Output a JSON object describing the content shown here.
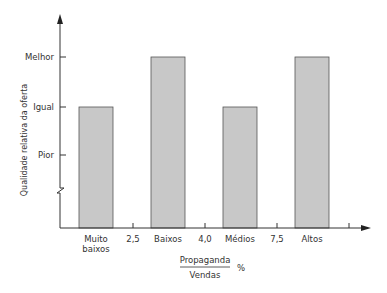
{
  "chart_data": {
    "type": "bar",
    "title": "",
    "ylabel": "Qualidade relativa da oferta",
    "xlabel_numerator": "Propaganda",
    "xlabel_denominator": "Vendas",
    "xlabel_unit": "%",
    "y_ticks": [
      "Pior",
      "Igual",
      "Melhor"
    ],
    "y_tick_values": [
      1,
      2,
      3
    ],
    "ylim": [
      0,
      4
    ],
    "y_axis_break": true,
    "categories": [
      "Muito baixos",
      "Baixos",
      "Médios",
      "Altos"
    ],
    "category_lines": [
      [
        "Muito",
        "baixos"
      ],
      [
        "Baixos"
      ],
      [
        "Médios"
      ],
      [
        "Altos"
      ]
    ],
    "boundary_labels": [
      "2,5",
      "4,0",
      "7,5"
    ],
    "values": [
      2,
      3,
      2,
      3
    ],
    "value_labels": [
      "Igual",
      "Melhor",
      "Igual",
      "Melhor"
    ],
    "bar_color": "#c8c8c8",
    "bar_stroke": "#555555",
    "grid": false,
    "legend": "none"
  }
}
